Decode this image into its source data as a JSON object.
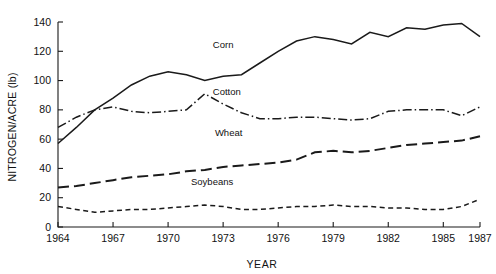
{
  "chart_data": {
    "type": "line",
    "title": "",
    "xlabel": "YEAR",
    "ylabel": "NITROGEN/ACRE (lb)",
    "xlim": [
      1964,
      1987
    ],
    "ylim": [
      0,
      140
    ],
    "xticks": [
      1964,
      1967,
      1970,
      1973,
      1976,
      1979,
      1982,
      1985,
      1987
    ],
    "yticks": [
      0,
      20,
      40,
      60,
      80,
      100,
      120,
      140
    ],
    "grid": false,
    "legend": "inline-series-labels",
    "x": [
      1964,
      1965,
      1966,
      1967,
      1968,
      1969,
      1970,
      1971,
      1972,
      1973,
      1974,
      1975,
      1976,
      1977,
      1978,
      1979,
      1980,
      1981,
      1982,
      1983,
      1984,
      1985,
      1986,
      1987
    ],
    "series": [
      {
        "name": "Corn",
        "color": "#1a1a1a",
        "style": "solid",
        "label_x": 1973.0,
        "label_y": 122,
        "values": [
          57,
          68,
          80,
          88,
          97,
          103,
          106,
          104,
          100,
          103,
          104,
          112,
          120,
          127,
          130,
          128,
          125,
          133,
          130,
          136,
          135,
          138,
          139,
          130
        ]
      },
      {
        "name": "Cotton",
        "color": "#1a1a1a",
        "style": "dash-dot",
        "label_x": 1973.2,
        "label_y": 90,
        "values": [
          68,
          75,
          80,
          82,
          79,
          78,
          79,
          80,
          91,
          84,
          78,
          74,
          74,
          75,
          75,
          74,
          73,
          74,
          79,
          80,
          80,
          80,
          76,
          82
        ]
      },
      {
        "name": "Wheat",
        "color": "#1a1a1a",
        "style": "long-dash",
        "label_x": 1973.3,
        "label_y": 62,
        "values": [
          27,
          28,
          30,
          32,
          34,
          35,
          36,
          38,
          39,
          41,
          42,
          43,
          44,
          46,
          51,
          52,
          51,
          52,
          54,
          56,
          57,
          58,
          59,
          62
        ]
      },
      {
        "name": "Soybeans",
        "color": "#1a1a1a",
        "style": "short-dash",
        "label_x": 1972.4,
        "label_y": 29,
        "values": [
          14,
          12,
          10,
          11,
          12,
          12,
          13,
          14,
          15,
          14,
          12,
          12,
          13,
          14,
          14,
          15,
          14,
          14,
          13,
          13,
          12,
          12,
          14,
          19
        ]
      }
    ]
  }
}
